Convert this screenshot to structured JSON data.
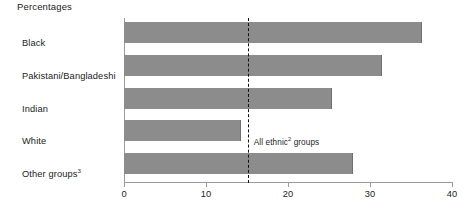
{
  "chart_data": {
    "type": "bar",
    "orientation": "horizontal",
    "title": "Percentages",
    "xlabel": "",
    "ylabel": "",
    "categories": [
      "Black",
      "Pakistani/Bangladeshi",
      "Indian",
      "White",
      "Other groups"
    ],
    "category_footnotes": [
      "",
      "",
      "",
      "",
      "3"
    ],
    "values": [
      36.2,
      31.3,
      25.2,
      14.1,
      27.8
    ],
    "xlim": [
      0,
      40
    ],
    "xticks": [
      0,
      10,
      20,
      30,
      40
    ],
    "xtick_labels": [
      "0",
      "10",
      "20",
      "30",
      "40"
    ],
    "grid": false,
    "legend": "none",
    "bar_color": "#8c8c8c",
    "axis_color": "#9a9a9a",
    "annotations": [
      {
        "name": "all-ethnic-groups-reference",
        "text": "All ethnic",
        "footnote": "2",
        "text_tail": " groups",
        "value": 15.1,
        "style": "dashed-vertical-line",
        "color": "#111111"
      }
    ]
  }
}
